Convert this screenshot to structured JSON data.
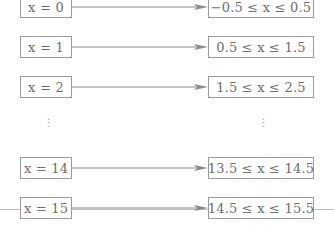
{
  "diagram": {
    "type": "mapping",
    "rows": [
      {
        "left": "x = 0",
        "right": "−0.5 ≤ x ≤ 0.5"
      },
      {
        "left": "x = 1",
        "right": "0.5 ≤ x ≤ 1.5"
      },
      {
        "left": "x = 2",
        "right": "1.5 ≤ x ≤ 2.5"
      },
      {
        "left": "⋮",
        "right": "⋮"
      },
      {
        "left": "x = 14",
        "right": "13.5 ≤ x ≤ 14.5"
      },
      {
        "left": "x = 15",
        "right": "14.5 ≤ x ≤ 15.5"
      }
    ],
    "colors": {
      "border": "#9a9a9a",
      "text": "#6e6e6e",
      "arrow": "#8a8a8a"
    }
  }
}
